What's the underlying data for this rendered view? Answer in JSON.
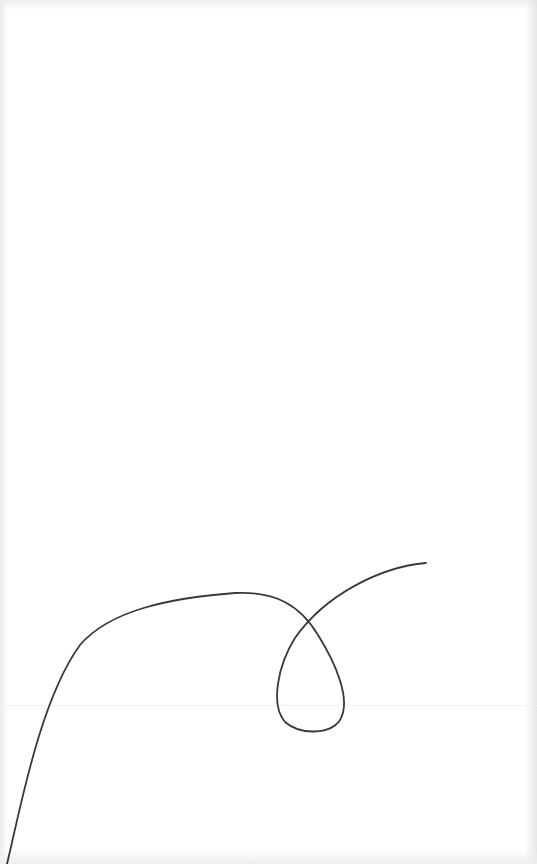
{
  "canvas": {
    "background": "#ffffff",
    "stroke_color": "#3a3a3a",
    "stroke_width": 1.8
  },
  "drawing": {
    "description": "single continuous hand-drawn line with a loop",
    "path": "M 7 864 C 20 810, 40 700, 80 645 C 110 610, 170 598, 235 593 C 275 591, 300 605, 318 635 C 335 662, 352 700, 340 720 C 330 735, 300 735, 285 722 C 270 705, 278 665, 295 638 C 325 595, 380 567, 426 563"
  }
}
